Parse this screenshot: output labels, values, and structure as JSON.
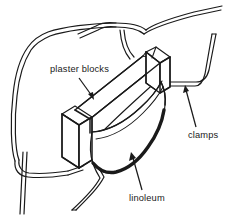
{
  "figure": {
    "type": "line-art technical illustration",
    "background_color": "#ffffff",
    "ink_color": "#1a1a1a",
    "width": 231,
    "height": 224
  },
  "labels": {
    "plaster_blocks": "plaster blocks",
    "clamps": "clamps",
    "linoleum": "linoleum"
  },
  "parts": [
    {
      "name": "plaster-blocks",
      "label": "plaster blocks",
      "description": "two angled rectangular plaster slabs forming a wedge-shaped mold"
    },
    {
      "name": "linoleum",
      "label": "linoleum",
      "description": "curved sheet of linoleum bent inside the mold cavity"
    },
    {
      "name": "clamps",
      "label": "clamps",
      "description": "bent wire clamps holding the assembly together"
    }
  ],
  "leaders": [
    {
      "name": "plaster-blocks-leader",
      "from_label": "plaster blocks",
      "direction": "down-right"
    },
    {
      "name": "clamps-leader",
      "from_label": "clamps",
      "direction": "up-left"
    },
    {
      "name": "linoleum-leader",
      "from_label": "linoleum",
      "direction": "up-left"
    }
  ]
}
